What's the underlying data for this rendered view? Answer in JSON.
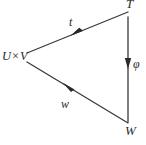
{
  "diagram": {
    "kind": "commutative-triangle",
    "stroke_color": "#3a3a3a",
    "background_color": "#ffffff",
    "nodes": [
      {
        "id": "domain",
        "label": "U×V",
        "x": 27,
        "y": 57
      },
      {
        "id": "codomain_top",
        "label": "T",
        "x": 130,
        "y": 10
      },
      {
        "id": "codomain_bottom",
        "label": "W",
        "x": 130,
        "y": 130
      }
    ],
    "edges": [
      {
        "id": "t",
        "label": "t",
        "from": "domain",
        "to": "codomain_top",
        "arrow": "mid-forward"
      },
      {
        "id": "w",
        "label": "w",
        "from": "domain",
        "to": "codomain_bottom",
        "arrow": "mid-backward"
      },
      {
        "id": "phi",
        "label": "φ",
        "from": "codomain_top",
        "to": "codomain_bottom",
        "arrow": "mid-forward"
      }
    ]
  }
}
